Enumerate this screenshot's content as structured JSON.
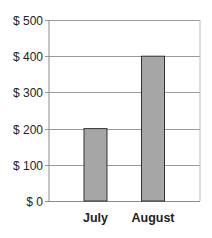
{
  "chart_data": {
    "type": "bar",
    "title": "",
    "xlabel": "",
    "ylabel": "",
    "categories": [
      "July",
      "August"
    ],
    "values": [
      200,
      400
    ],
    "ylim": [
      0,
      500
    ],
    "yticks": [
      0,
      100,
      200,
      300,
      400,
      500
    ],
    "ytick_labels": [
      "$ 0",
      "$ 100",
      "$ 200",
      "$ 300",
      "$ 400",
      "$ 500"
    ],
    "grid": true,
    "legend": null,
    "colors": {
      "bar_fill": "#a6a6a6",
      "bar_stroke": "#333333",
      "grid": "#9a9a9a",
      "axis": "#8a8a8a"
    }
  }
}
